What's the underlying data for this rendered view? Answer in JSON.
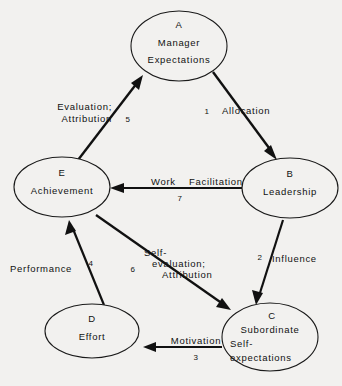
{
  "diagram": {
    "background_color": "#f2f1ef",
    "line_color": "#111111",
    "nodes": [
      {
        "id": "A",
        "letter": "A",
        "lines": [
          "Manager",
          "Expectations"
        ],
        "line1": "Manager",
        "line2": "Expectations",
        "line3": "",
        "cx": 179,
        "cy": 46,
        "rx": 48,
        "ry": 35
      },
      {
        "id": "B",
        "letter": "B",
        "lines": [
          "Leadership"
        ],
        "line1": "Leadership",
        "line2": "",
        "line3": "",
        "cx": 290,
        "cy": 188,
        "rx": 48,
        "ry": 30
      },
      {
        "id": "C",
        "letter": "C",
        "lines": [
          "Subordinate",
          "Self-",
          "expectations"
        ],
        "line1": "Subordinate",
        "line2": "Self-",
        "line3": "expectations",
        "cx": 270,
        "cy": 337,
        "rx": 48,
        "ry": 34
      },
      {
        "id": "D",
        "letter": "D",
        "lines": [
          "Effort"
        ],
        "line1": "Effort",
        "line2": "",
        "line3": "",
        "cx": 92,
        "cy": 331,
        "rx": 47,
        "ry": 27
      },
      {
        "id": "E",
        "letter": "E",
        "lines": [
          "Achievement"
        ],
        "line1": "Achievement",
        "line2": "",
        "line3": "",
        "cx": 62,
        "cy": 187,
        "rx": 48,
        "ry": 30
      }
    ],
    "edges": [
      {
        "id": "edge-1",
        "number": "1",
        "label_line1": "Allocation",
        "label_line2": "",
        "label_line3": "",
        "from": "A",
        "to": "B"
      },
      {
        "id": "edge-2",
        "number": "2",
        "label_line1": "Influence",
        "label_line2": "",
        "label_line3": "",
        "from": "B",
        "to": "C"
      },
      {
        "id": "edge-3",
        "number": "3",
        "label_line1": "Motivation",
        "label_line2": "",
        "label_line3": "",
        "from": "C",
        "to": "D"
      },
      {
        "id": "edge-4",
        "number": "4",
        "label_line1": "Performance",
        "label_line2": "",
        "label_line3": "",
        "from": "D",
        "to": "E"
      },
      {
        "id": "edge-5",
        "number": "5",
        "label_line1": "Evaluation;",
        "label_line2": "Attribution",
        "label_line3": "",
        "from": "E",
        "to": "A"
      },
      {
        "id": "edge-6",
        "number": "6",
        "label_line1": "Self-",
        "label_line2": "evaluation;",
        "label_line3": "Attribution",
        "from": "E",
        "to": "C"
      },
      {
        "id": "edge-7",
        "number": "7",
        "label_line1": "Work",
        "label_line2": "Facilitation",
        "label_line3": "",
        "from": "B",
        "to": "E"
      }
    ]
  }
}
